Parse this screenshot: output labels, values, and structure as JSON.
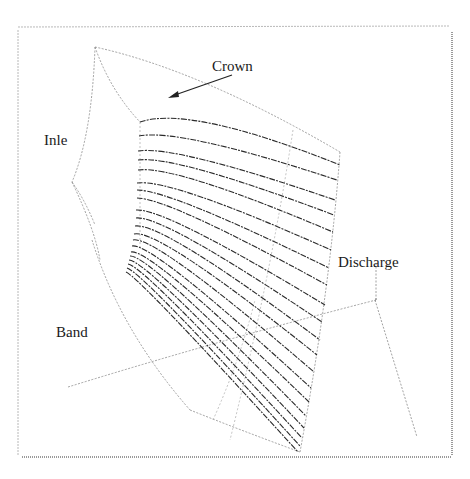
{
  "figure": {
    "type": "impeller-blade-mesh-diagram",
    "labels": {
      "crown": "Crown",
      "inlet": "Inle",
      "band": "Band",
      "discharge": "Discharge"
    },
    "colors": {
      "ink": "#1a1a1a",
      "blade_line": "#2a2a2a",
      "outline": "#8a8a8a",
      "frame": "#b8b8b8",
      "background": "#ffffff"
    },
    "blade_line_count": 20
  }
}
